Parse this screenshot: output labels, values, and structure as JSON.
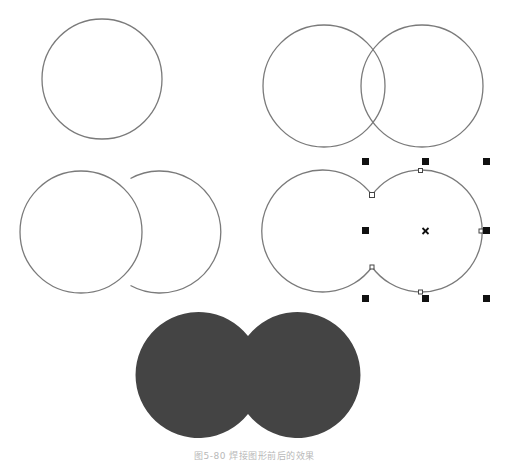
{
  "figure": {
    "caption": "图5-80  焊接图形前后的效果",
    "panels": [
      {
        "id": "step-1",
        "description": "single circle",
        "circles": [
          {
            "cx": 102,
            "cy": 79,
            "r": 60
          }
        ]
      },
      {
        "id": "step-2",
        "description": "two overlapping circles",
        "circles": [
          {
            "cx": 324,
            "cy": 86,
            "r": 61
          },
          {
            "cx": 422,
            "cy": 86,
            "r": 61
          }
        ]
      },
      {
        "id": "step-3",
        "description": "circles arranged side by side, right behind left",
        "circles": [
          {
            "cx": 81,
            "cy": 232,
            "r": 61
          },
          {
            "cx": 176,
            "cy": 232,
            "r": 61
          }
        ]
      },
      {
        "id": "step-4",
        "description": "welded outline, selected with bounding-box handles",
        "selection": {
          "left": 365,
          "top": 161,
          "right": 487,
          "bottom": 298
        },
        "center_mark": "×"
      },
      {
        "id": "step-5",
        "description": "filled welded shape",
        "fill": "#444444"
      }
    ],
    "colors": {
      "outline": "#7a7a7a",
      "handle": "#111111",
      "fill": "#444444",
      "background": "#ffffff"
    }
  }
}
